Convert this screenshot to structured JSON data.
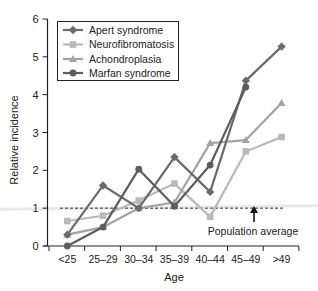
{
  "chart_data": {
    "type": "line",
    "title": "",
    "xlabel": "Age",
    "ylabel": "Relative incidence",
    "categories": [
      "<25",
      "25–29",
      "30–34",
      "35–39",
      "40–44",
      "45–49",
      ">49"
    ],
    "ylim": [
      0,
      6
    ],
    "yticks": [
      0,
      1,
      2,
      3,
      4,
      5,
      6
    ],
    "grid": false,
    "legend_position": "top-left (boxed)",
    "series": [
      {
        "name": "Apert syndrome",
        "marker": "diamond",
        "color": "#6b6b6b",
        "values": [
          0.3,
          1.6,
          1.0,
          2.35,
          1.43,
          4.37,
          5.27
        ]
      },
      {
        "name": "Neurofibromatosis",
        "marker": "square",
        "color": "#b9b9b9",
        "values": [
          0.66,
          0.8,
          1.2,
          1.65,
          0.77,
          2.5,
          2.88
        ]
      },
      {
        "name": "Achondroplasia",
        "marker": "triangle",
        "color": "#a3a3a3",
        "values": [
          0.3,
          0.5,
          1.0,
          1.15,
          2.72,
          2.8,
          3.78
        ]
      },
      {
        "name": "Marfan syndrome",
        "marker": "circle",
        "color": "#5d5d5d",
        "values": [
          0.0,
          0.5,
          2.03,
          1.05,
          2.14,
          4.2,
          null
        ]
      }
    ],
    "reference_line": {
      "value": 1.0,
      "style": "dashed",
      "label": "Population average"
    }
  },
  "annotation": {
    "text": "Population average"
  }
}
